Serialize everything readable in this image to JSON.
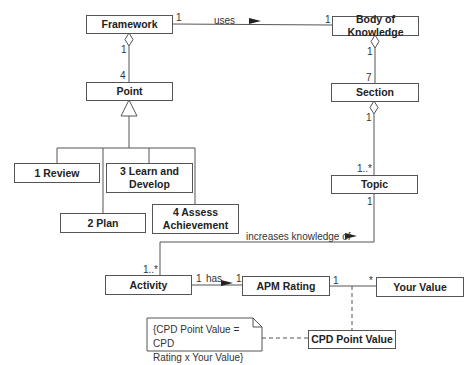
{
  "diagram": {
    "type": "UML class diagram",
    "classes": {
      "framework": "Framework",
      "body_of_knowledge": "Body of Knowledge",
      "point": "Point",
      "section": "Section",
      "topic": "Topic",
      "review": "1 Review",
      "learn_develop": "3 Learn and Develop",
      "plan": "2 Plan",
      "assess": "4 Assess Achievement",
      "activity": "Activity",
      "apm_rating": "APM Rating",
      "your_value": "Your Value",
      "cpd_point_value": "CPD Point Value"
    },
    "associations": {
      "uses": {
        "label": "uses",
        "mult_source": "1",
        "mult_target": "1"
      },
      "framework_point": {
        "mult_source": "1",
        "mult_target": "4"
      },
      "bok_section": {
        "mult_source": "1",
        "mult_target": "7"
      },
      "section_topic": {
        "mult_source": "1",
        "mult_target": "1..*"
      },
      "increases": {
        "label": "increases knowledge of",
        "mult_topic": "1",
        "mult_activity": "1..*"
      },
      "has": {
        "label": "has",
        "mult_source": "1",
        "mult_target": "1"
      },
      "rating_value": {
        "mult_source": "1",
        "mult_target": "*"
      }
    },
    "note": {
      "line1": "{CPD Point Value = CPD",
      "line2": "Rating x Your Value}"
    }
  }
}
